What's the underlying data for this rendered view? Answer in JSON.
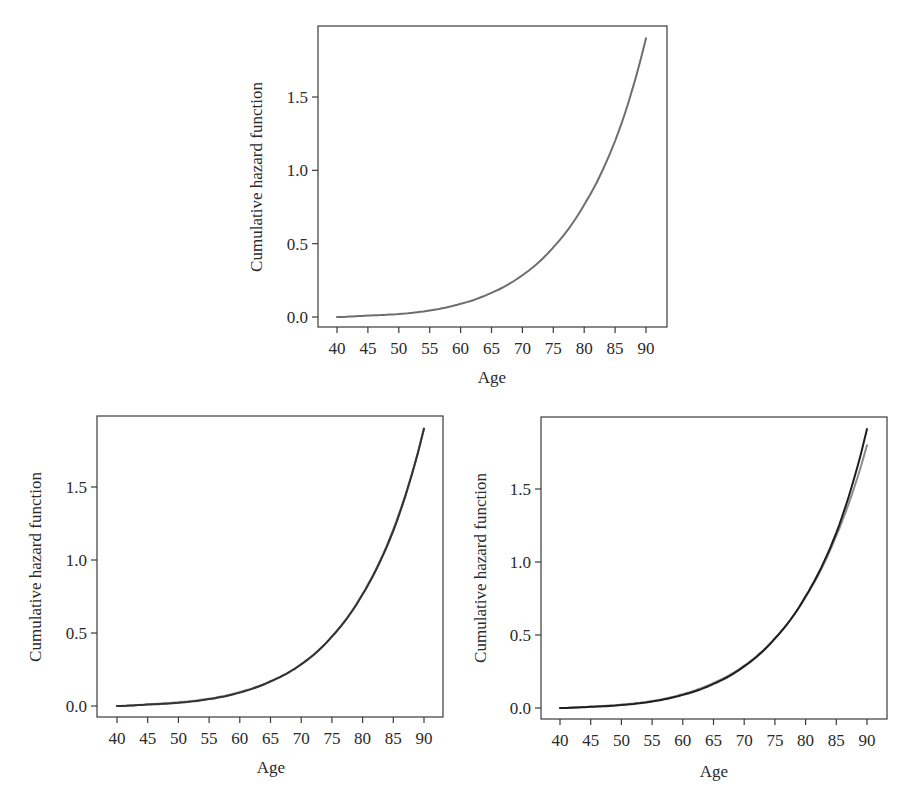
{
  "chart_data": [
    {
      "type": "line",
      "panel": "top",
      "title": "",
      "xlabel": "Age",
      "ylabel": "Cumulative hazard function",
      "xlim": [
        40,
        90
      ],
      "ylim": [
        0,
        1.9
      ],
      "grid": false,
      "legend": null,
      "x_ticks": [
        40,
        45,
        50,
        55,
        60,
        65,
        70,
        75,
        80,
        85,
        90
      ],
      "x_tick_labels": [
        "40",
        "45",
        "50",
        "55",
        "60",
        "65",
        "70",
        "75",
        "80",
        "85",
        "90"
      ],
      "y_ticks": [
        0.0,
        0.5,
        1.0,
        1.5
      ],
      "y_tick_labels": [
        "0.0",
        "0.5",
        "1.0",
        "1.5"
      ],
      "x": [
        40,
        45,
        50,
        55,
        60,
        65,
        70,
        75,
        80,
        85,
        90
      ],
      "series": [
        {
          "name": "curve 1",
          "color": "#6e6e6e",
          "values": [
            0.0,
            0.01,
            0.02,
            0.045,
            0.09,
            0.165,
            0.285,
            0.475,
            0.765,
            1.2,
            1.9
          ]
        }
      ]
    },
    {
      "type": "line",
      "panel": "bottom-left",
      "title": "",
      "xlabel": "Age",
      "ylabel": "Cumulative hazard function",
      "xlim": [
        40,
        90
      ],
      "ylim": [
        0,
        1.9
      ],
      "grid": false,
      "legend": null,
      "x_ticks": [
        40,
        45,
        50,
        55,
        60,
        65,
        70,
        75,
        80,
        85,
        90
      ],
      "x_tick_labels": [
        "40",
        "45",
        "50",
        "55",
        "60",
        "65",
        "70",
        "75",
        "80",
        "85",
        "90"
      ],
      "y_ticks": [
        0.0,
        0.5,
        1.0,
        1.5
      ],
      "y_tick_labels": [
        "0.0",
        "0.5",
        "1.0",
        "1.5"
      ],
      "x": [
        40,
        45,
        50,
        55,
        60,
        65,
        70,
        75,
        80,
        85,
        90
      ],
      "series": [
        {
          "name": "curve 1",
          "color": "#333333",
          "values": [
            0.0,
            0.01,
            0.022,
            0.047,
            0.092,
            0.168,
            0.285,
            0.475,
            0.765,
            1.2,
            1.9
          ]
        },
        {
          "name": "curve 2",
          "color": "#8a8a8a",
          "values": [
            0.0,
            0.012,
            0.025,
            0.05,
            0.096,
            0.17,
            0.287,
            0.477,
            0.768,
            1.21,
            1.9
          ]
        }
      ]
    },
    {
      "type": "line",
      "panel": "bottom-right",
      "title": "",
      "xlabel": "Age",
      "ylabel": "Cumulative hazard function",
      "xlim": [
        40,
        90
      ],
      "ylim": [
        0,
        1.9
      ],
      "grid": false,
      "legend": null,
      "x_ticks": [
        40,
        45,
        50,
        55,
        60,
        65,
        70,
        75,
        80,
        85,
        90
      ],
      "x_tick_labels": [
        "40",
        "45",
        "50",
        "55",
        "60",
        "65",
        "70",
        "75",
        "80",
        "85",
        "90"
      ],
      "y_ticks": [
        0.0,
        0.5,
        1.0,
        1.5
      ],
      "y_tick_labels": [
        "0.0",
        "0.5",
        "1.0",
        "1.5"
      ],
      "x": [
        40,
        45,
        50,
        55,
        60,
        65,
        70,
        75,
        80,
        85,
        90
      ],
      "series": [
        {
          "name": "curve 1",
          "color": "#1e1e1e",
          "values": [
            0.0,
            0.008,
            0.02,
            0.045,
            0.09,
            0.165,
            0.285,
            0.475,
            0.765,
            1.2,
            1.91
          ]
        },
        {
          "name": "curve 2",
          "color": "#8c8c8c",
          "values": [
            0.0,
            0.01,
            0.023,
            0.048,
            0.095,
            0.172,
            0.29,
            0.478,
            0.76,
            1.18,
            1.8
          ]
        }
      ]
    }
  ],
  "panels": [
    {
      "id": "top",
      "xlabel": "Age",
      "ylabel": "Cumulative hazard function"
    },
    {
      "id": "bottom-left",
      "xlabel": "Age",
      "ylabel": "Cumulative hazard function"
    },
    {
      "id": "bottom-right",
      "xlabel": "Age",
      "ylabel": "Cumulative hazard function"
    }
  ]
}
